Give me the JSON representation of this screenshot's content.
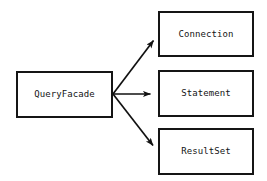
{
  "diagram": {
    "type": "facade-pattern-class-diagram",
    "canvas": {
      "width": 267,
      "height": 181,
      "background": "#ffffff"
    },
    "style": {
      "box_border_color": "#151515",
      "box_fill_color": "#ffffff",
      "edge_color": "#111111",
      "text_color": "#141414"
    },
    "nodes": [
      {
        "id": "query-facade",
        "label": "QueryFacade",
        "x": 16,
        "y": 71,
        "width": 97,
        "height": 47,
        "role": "facade"
      },
      {
        "id": "connection",
        "label": "Connection",
        "x": 158,
        "y": 11,
        "width": 96,
        "height": 46,
        "role": "subsystem"
      },
      {
        "id": "statement",
        "label": "Statement",
        "x": 158,
        "y": 70,
        "width": 96,
        "height": 47,
        "role": "subsystem"
      },
      {
        "id": "result-set",
        "label": "ResultSet",
        "x": 158,
        "y": 128,
        "width": 96,
        "height": 47,
        "role": "subsystem"
      }
    ],
    "edges": [
      {
        "id": "facade-to-connection",
        "from": "query-facade",
        "to": "connection",
        "arrowhead": "solid-filled",
        "x1": 113,
        "y1": 94,
        "x2": 157,
        "y2": 36
      },
      {
        "id": "facade-to-statement",
        "from": "query-facade",
        "to": "statement",
        "arrowhead": "solid-filled",
        "x1": 113,
        "y1": 94,
        "x2": 157,
        "y2": 94
      },
      {
        "id": "facade-to-result-set",
        "from": "query-facade",
        "to": "result-set",
        "arrowhead": "solid-filled",
        "x1": 113,
        "y1": 94,
        "x2": 157,
        "y2": 150
      }
    ]
  }
}
